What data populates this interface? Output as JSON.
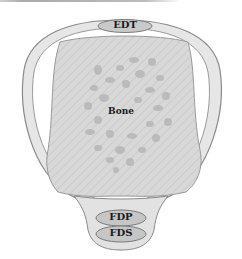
{
  "diagram": {
    "type": "anatomical cross-section",
    "labels": {
      "top_tendon": "EDT",
      "center": "Bone",
      "bottom_upper_tendon": "FDP",
      "bottom_lower_tendon": "FDS"
    },
    "colors": {
      "outline": "#8a8a8a",
      "sheath_fill": "#e2e2e2",
      "bone_fill": "#d6d6d6",
      "trabecular": "#b4b4b4",
      "tendon_fill": "#c6c6c6",
      "text": "#1a1a1a"
    }
  }
}
